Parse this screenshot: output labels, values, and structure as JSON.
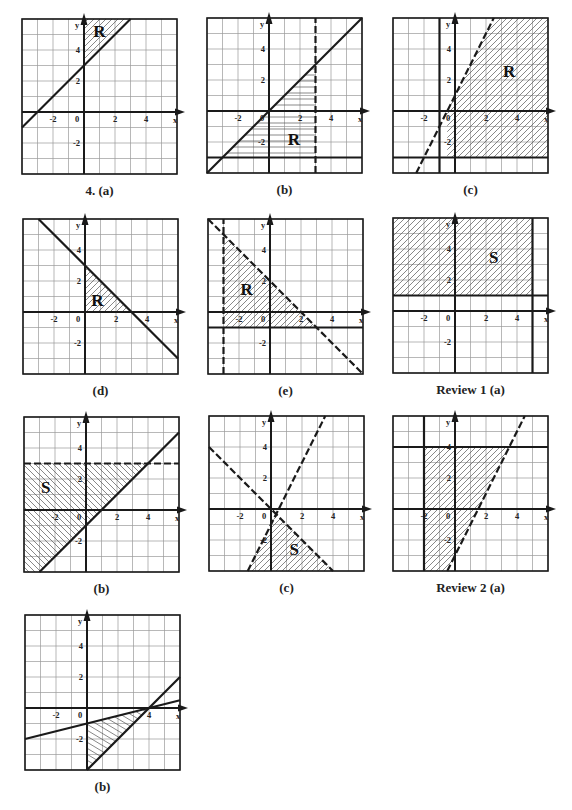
{
  "page": {
    "background": "#ffffff",
    "ink": "#1a1a1a",
    "grid_color": "#9a9a9a",
    "hatch_color": "#555555"
  },
  "chart_data": [
    {
      "id": "g4a",
      "caption": "4. (a)",
      "type": "region-inequality",
      "frame": {
        "left": 22,
        "top": 19,
        "size": 155
      },
      "xlim": [
        -4,
        6
      ],
      "ylim": [
        -4,
        6
      ],
      "xticks": [
        -2,
        0,
        2,
        4
      ],
      "yticks": [
        4,
        2,
        -2
      ],
      "xlabel": "x",
      "ylabel": "y",
      "lines": [
        {
          "p1": [
            -4,
            -1
          ],
          "p2": [
            3,
            6
          ],
          "style": "solid",
          "equation": "y = x + 3"
        }
      ],
      "shaded": {
        "polygon": [
          [
            0,
            3
          ],
          [
            3,
            6
          ],
          [
            0,
            6
          ]
        ],
        "hatch": "diag"
      },
      "region_label": {
        "text": "R",
        "at": [
          1,
          5.2
        ]
      }
    },
    {
      "id": "g4b",
      "caption": "(b)",
      "type": "region-inequality",
      "frame": {
        "left": 207,
        "top": 18,
        "size": 155
      },
      "xlim": [
        -4,
        6
      ],
      "ylim": [
        -4,
        6
      ],
      "xticks": [
        -2,
        0,
        2,
        4
      ],
      "yticks": [
        4,
        2,
        -2
      ],
      "xlabel": "x",
      "ylabel": "y",
      "lines": [
        {
          "p1": [
            -4,
            -4
          ],
          "p2": [
            6,
            6
          ],
          "style": "solid",
          "equation": "y = x"
        },
        {
          "p1": [
            3,
            -4
          ],
          "p2": [
            3,
            6
          ],
          "style": "dashed",
          "equation": "x = 3"
        },
        {
          "p1": [
            -4,
            -3
          ],
          "p2": [
            6,
            -3
          ],
          "style": "solid",
          "equation": "y = -3"
        }
      ],
      "shaded": {
        "polygon": [
          [
            -3,
            -3
          ],
          [
            3,
            3
          ],
          [
            3,
            -3
          ]
        ],
        "hatch": "horizontal"
      },
      "region_label": {
        "text": "R",
        "at": [
          1.6,
          -1.8
        ]
      }
    },
    {
      "id": "g4c",
      "caption": "(c)",
      "type": "region-inequality",
      "frame": {
        "left": 393,
        "top": 18,
        "size": 155
      },
      "xlim": [
        -4,
        6
      ],
      "ylim": [
        -4,
        6
      ],
      "xticks": [
        -2,
        0,
        2,
        4
      ],
      "yticks": [
        4,
        2,
        -2
      ],
      "xlabel": "x",
      "ylabel": "y",
      "lines": [
        {
          "p1": [
            -1,
            -4
          ],
          "p2": [
            -1,
            6
          ],
          "style": "solid",
          "equation": "x = -1"
        },
        {
          "p1": [
            -2.5,
            -4
          ],
          "p2": [
            2.5,
            6
          ],
          "style": "dashed",
          "equation": "y = 2x + 1"
        },
        {
          "p1": [
            -4,
            -3
          ],
          "p2": [
            6,
            -3
          ],
          "style": "solid",
          "equation": "y = -3"
        }
      ],
      "shaded": {
        "polygon": [
          [
            -0.5,
            0
          ],
          [
            2.5,
            6
          ],
          [
            6,
            6
          ],
          [
            6,
            -3
          ],
          [
            -0.5,
            -3
          ],
          [
            -0.5,
            0
          ]
        ],
        "hatch": "diag"
      },
      "region_label": {
        "text": "R",
        "at": [
          3.5,
          2.6
        ]
      }
    },
    {
      "id": "g4d",
      "caption": "(d)",
      "type": "region-inequality",
      "frame": {
        "left": 23,
        "top": 219,
        "size": 155
      },
      "xlim": [
        -4,
        6
      ],
      "ylim": [
        -4,
        6
      ],
      "xticks": [
        -2,
        0,
        2,
        4
      ],
      "yticks": [
        4,
        2,
        -2
      ],
      "xlabel": "x",
      "ylabel": "y",
      "lines": [
        {
          "p1": [
            -3,
            6
          ],
          "p2": [
            6,
            -3
          ],
          "style": "solid",
          "equation": "y = -x + 3"
        }
      ],
      "shaded": {
        "polygon": [
          [
            0,
            0
          ],
          [
            3,
            0
          ],
          [
            0,
            3
          ]
        ],
        "hatch": "diag"
      },
      "region_label": {
        "text": "R",
        "at": [
          0.8,
          0.8
        ]
      }
    },
    {
      "id": "g4e",
      "caption": "(e)",
      "type": "region-inequality",
      "frame": {
        "left": 208,
        "top": 219,
        "size": 155
      },
      "xlim": [
        -4,
        6
      ],
      "ylim": [
        -4,
        6
      ],
      "xticks": [
        -2,
        0,
        2,
        4
      ],
      "yticks": [
        4,
        2,
        -2
      ],
      "xlabel": "x",
      "ylabel": "y",
      "lines": [
        {
          "p1": [
            -3,
            -4
          ],
          "p2": [
            -3,
            6
          ],
          "style": "dashed",
          "equation": "x = -3"
        },
        {
          "p1": [
            -4,
            6
          ],
          "p2": [
            6,
            -4
          ],
          "style": "dashed",
          "equation": "y = -x + 2"
        },
        {
          "p1": [
            -4,
            -1
          ],
          "p2": [
            6,
            -1
          ],
          "style": "solid",
          "equation": "y = -1"
        }
      ],
      "shaded": {
        "polygon": [
          [
            -3,
            5
          ],
          [
            3,
            -1
          ],
          [
            -3,
            -1
          ]
        ],
        "hatch": "diag"
      },
      "region_label": {
        "text": "R",
        "at": [
          -1.5,
          1.5
        ]
      }
    },
    {
      "id": "r1a",
      "caption": "Review 1 (a)",
      "type": "region-inequality",
      "frame": {
        "left": 393,
        "top": 218,
        "size": 155
      },
      "xlim": [
        -4,
        6
      ],
      "ylim": [
        -4,
        6
      ],
      "xticks": [
        -2,
        0,
        2,
        4
      ],
      "yticks": [
        4,
        2,
        -2
      ],
      "xlabel": "x",
      "ylabel": "y",
      "lines": [
        {
          "p1": [
            -4,
            1
          ],
          "p2": [
            6,
            1
          ],
          "style": "solid",
          "equation": "y = 1"
        },
        {
          "p1": [
            5,
            -4
          ],
          "p2": [
            5,
            6
          ],
          "style": "solid",
          "equation": "x = 5"
        }
      ],
      "shaded": {
        "polygon": [
          [
            -4,
            1
          ],
          [
            5,
            1
          ],
          [
            5,
            6
          ],
          [
            -4,
            6
          ]
        ],
        "hatch": "diag"
      },
      "region_label": {
        "text": "S",
        "at": [
          2.5,
          3.5
        ]
      }
    },
    {
      "id": "r1b",
      "caption": "(b)",
      "type": "region-inequality",
      "frame": {
        "left": 24,
        "top": 417,
        "size": 155
      },
      "xlim": [
        -4,
        6
      ],
      "ylim": [
        -4,
        6
      ],
      "xticks": [
        -2,
        0,
        2,
        4
      ],
      "yticks": [
        4,
        2,
        -2
      ],
      "xlabel": "x",
      "ylabel": "y",
      "lines": [
        {
          "p1": [
            -4,
            3
          ],
          "p2": [
            6,
            3
          ],
          "style": "dashed",
          "equation": "y = 3"
        },
        {
          "p1": [
            -3,
            -4
          ],
          "p2": [
            6,
            5
          ],
          "style": "solid",
          "equation": "y = x - 1"
        }
      ],
      "shaded": {
        "polygon": [
          [
            -4,
            3
          ],
          [
            4,
            3
          ],
          [
            -3,
            -4
          ],
          [
            -4,
            -4
          ]
        ],
        "hatch": "back-diag"
      },
      "region_label": {
        "text": "S",
        "at": [
          -2.6,
          1.5
        ]
      }
    },
    {
      "id": "r1c",
      "caption": "(c)",
      "type": "region-inequality",
      "frame": {
        "left": 209,
        "top": 416,
        "size": 155
      },
      "xlim": [
        -4,
        6
      ],
      "ylim": [
        -4,
        6
      ],
      "xticks": [
        -2,
        0,
        2,
        4
      ],
      "yticks": [
        4,
        2,
        -2
      ],
      "xlabel": "x",
      "ylabel": "y",
      "lines": [
        {
          "p1": [
            -4,
            4
          ],
          "p2": [
            4,
            -4
          ],
          "style": "dashed",
          "equation": "y = -x"
        },
        {
          "p1": [
            -1.5,
            -4
          ],
          "p2": [
            3.5,
            6
          ],
          "style": "dashed",
          "equation": "y = 2x - 1"
        }
      ],
      "shaded": {
        "polygon": [
          [
            0.33,
            -0.33
          ],
          [
            4,
            -4
          ],
          [
            -1.5,
            -4
          ]
        ],
        "hatch": "diag"
      },
      "region_label": {
        "text": "S",
        "at": [
          1.5,
          -2.6
        ]
      }
    },
    {
      "id": "r2a",
      "caption": "Review 2 (a)",
      "type": "region-inequality",
      "frame": {
        "left": 393,
        "top": 416,
        "size": 155
      },
      "xlim": [
        -4,
        6
      ],
      "ylim": [
        -4,
        6
      ],
      "xticks": [
        -2,
        0,
        2,
        4
      ],
      "yticks": [
        4,
        2,
        -2
      ],
      "xlabel": "x",
      "ylabel": "y",
      "lines": [
        {
          "p1": [
            -2,
            -4
          ],
          "p2": [
            -2,
            6
          ],
          "style": "solid",
          "equation": "x = -2"
        },
        {
          "p1": [
            -4,
            4
          ],
          "p2": [
            6,
            4
          ],
          "style": "solid",
          "equation": "y = 4"
        },
        {
          "p1": [
            -0.5,
            -4
          ],
          "p2": [
            4.5,
            6
          ],
          "style": "dashed",
          "equation": "y = 2x - 3"
        }
      ],
      "shaded": {
        "polygon": [
          [
            -2,
            4
          ],
          [
            3.5,
            4
          ],
          [
            -0.5,
            -4
          ],
          [
            -2,
            -4
          ]
        ],
        "hatch": "diag"
      },
      "region_label": {
        "text": "",
        "at": [
          0,
          0
        ]
      }
    },
    {
      "id": "r2b",
      "caption": "(b)",
      "type": "region-inequality",
      "frame": {
        "left": 25,
        "top": 615,
        "size": 155
      },
      "xlim": [
        -4,
        6
      ],
      "ylim": [
        -4,
        6
      ],
      "xticks": [
        -2,
        0,
        4
      ],
      "yticks": [
        4,
        2,
        -2
      ],
      "xlabel": "x",
      "ylabel": "y",
      "lines": [
        {
          "p1": [
            -4,
            -2
          ],
          "p2": [
            6,
            0.5
          ],
          "style": "solid",
          "equation": "y = x/4 - 1"
        },
        {
          "p1": [
            0,
            -4
          ],
          "p2": [
            6,
            2
          ],
          "style": "solid",
          "equation": "y = x - 4"
        }
      ],
      "shaded": {
        "polygon": [
          [
            0,
            -1
          ],
          [
            4,
            0
          ],
          [
            0,
            -4
          ]
        ],
        "hatch": "back-diag-flat"
      },
      "region_label": {
        "text": "",
        "at": [
          0,
          0
        ]
      }
    }
  ]
}
